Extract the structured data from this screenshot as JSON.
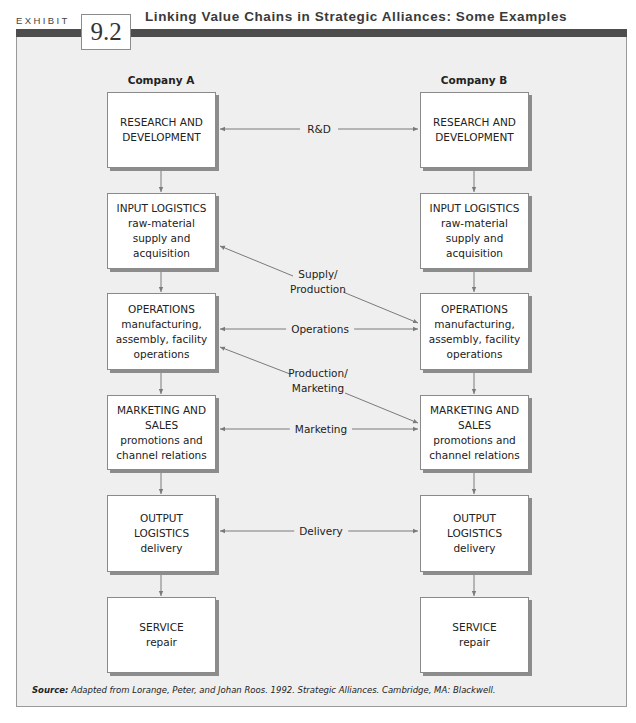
{
  "header": {
    "exhibit_label": "EXHIBIT",
    "exhibit_number": "9.2",
    "title": "Linking Value Chains in Strategic Alliances: Some Examples"
  },
  "columns": {
    "a": "Company A",
    "b": "Company B"
  },
  "company_a": [
    {
      "title": "RESEARCH AND DEVELOPMENT",
      "sub": ""
    },
    {
      "title": "INPUT LOGISTICS",
      "sub": "raw-material supply and acquisition"
    },
    {
      "title": "OPERATIONS",
      "sub": "manufacturing, assembly, facility operations"
    },
    {
      "title": "MARKETING AND SALES",
      "sub": "promotions and channel relations"
    },
    {
      "title": "OUTPUT LOGISTICS",
      "sub": "delivery"
    },
    {
      "title": "SERVICE",
      "sub": "repair"
    }
  ],
  "company_b": [
    {
      "title": "RESEARCH AND DEVELOPMENT",
      "sub": ""
    },
    {
      "title": "INPUT LOGISTICS",
      "sub": "raw-material supply and acquisition"
    },
    {
      "title": "OPERATIONS",
      "sub": "manufacturing, assembly, facility operations"
    },
    {
      "title": "MARKETING AND SALES",
      "sub": "promotions and channel relations"
    },
    {
      "title": "OUTPUT LOGISTICS",
      "sub": "delivery"
    },
    {
      "title": "SERVICE",
      "sub": "repair"
    }
  ],
  "links": {
    "rd": "R&D",
    "supply_production_1": "Supply/",
    "supply_production_2": "Production",
    "operations": "Operations",
    "production_marketing_1": "Production/",
    "production_marketing_2": "Marketing",
    "marketing": "Marketing",
    "delivery": "Delivery"
  },
  "source": {
    "label": "Source:",
    "text": "Adapted from Lorange, Peter, and Johan Roos. 1992. Strategic Alliances. Cambridge, MA: Blackwell."
  },
  "colors": {
    "panel_bg": "#efefef",
    "band": "#4d4d4d",
    "box_border": "#8a8a8a",
    "line": "#7a7a7a"
  }
}
